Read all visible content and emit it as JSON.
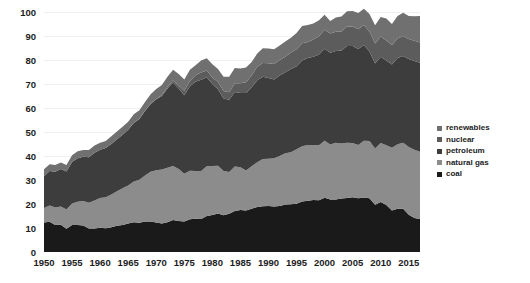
{
  "chart_data": {
    "type": "area",
    "title": "",
    "subtitle": "",
    "xlabel": "",
    "ylabel": "",
    "stacked": true,
    "grid": true,
    "legend_position": "right",
    "xlim": [
      1950,
      2017
    ],
    "ylim": [
      0,
      100
    ],
    "yticks": [
      0,
      10,
      20,
      30,
      40,
      50,
      60,
      70,
      80,
      90,
      100
    ],
    "xticks": [
      1950,
      1955,
      1960,
      1965,
      1970,
      1975,
      1980,
      1985,
      1990,
      1995,
      2000,
      2005,
      2010,
      2015
    ],
    "x": [
      1950,
      1951,
      1952,
      1953,
      1954,
      1955,
      1956,
      1957,
      1958,
      1959,
      1960,
      1961,
      1962,
      1963,
      1964,
      1965,
      1966,
      1967,
      1968,
      1969,
      1970,
      1971,
      1972,
      1973,
      1974,
      1975,
      1976,
      1977,
      1978,
      1979,
      1980,
      1981,
      1982,
      1983,
      1984,
      1985,
      1986,
      1987,
      1988,
      1989,
      1990,
      1991,
      1992,
      1993,
      1994,
      1995,
      1996,
      1997,
      1998,
      1999,
      2000,
      2001,
      2002,
      2003,
      2004,
      2005,
      2006,
      2007,
      2008,
      2009,
      2010,
      2011,
      2012,
      2013,
      2014,
      2015,
      2016,
      2017
    ],
    "series": [
      {
        "name": "coal",
        "color": "#1a1a1a",
        "values": [
          12.3,
          12.6,
          11.3,
          11.4,
          9.7,
          11.2,
          11.3,
          11.0,
          9.8,
          9.8,
          10.1,
          9.9,
          10.3,
          10.9,
          11.3,
          11.9,
          12.4,
          12.2,
          12.7,
          12.7,
          12.3,
          11.9,
          12.4,
          13.3,
          12.9,
          12.7,
          13.6,
          13.9,
          13.8,
          15.0,
          15.4,
          16.0,
          15.3,
          15.9,
          17.1,
          17.5,
          17.3,
          18.0,
          18.8,
          19.1,
          19.2,
          19.0,
          19.2,
          19.8,
          19.9,
          20.1,
          21.0,
          21.4,
          21.7,
          21.6,
          22.6,
          21.9,
          21.9,
          22.3,
          22.5,
          22.8,
          22.4,
          22.7,
          22.4,
          19.7,
          20.8,
          19.6,
          17.3,
          18.0,
          18.0,
          15.5,
          14.2,
          13.8
        ]
      },
      {
        "name": "natural gas",
        "color": "#8c8c8c",
        "values": [
          6.0,
          6.8,
          7.2,
          7.6,
          8.0,
          9.0,
          9.6,
          10.2,
          10.7,
          11.7,
          12.4,
          12.9,
          13.7,
          14.4,
          15.3,
          15.8,
          17.0,
          17.9,
          19.2,
          20.7,
          21.8,
          22.5,
          22.7,
          22.5,
          21.7,
          19.9,
          20.3,
          19.9,
          20.0,
          20.7,
          20.4,
          19.9,
          18.5,
          17.4,
          18.5,
          17.8,
          16.7,
          17.7,
          18.6,
          19.7,
          19.7,
          20.1,
          20.8,
          21.3,
          21.7,
          22.7,
          23.1,
          23.2,
          22.9,
          22.9,
          23.8,
          22.9,
          23.6,
          22.9,
          23.0,
          22.6,
          22.2,
          23.7,
          23.8,
          23.4,
          24.6,
          24.9,
          26.1,
          26.9,
          27.5,
          28.2,
          28.4,
          28.0
        ]
      },
      {
        "name": "petroleum",
        "color": "#3d3d3d",
        "values": [
          13.3,
          14.4,
          14.9,
          15.6,
          15.8,
          17.3,
          18.2,
          18.5,
          19.0,
          19.9,
          20.1,
          20.5,
          21.0,
          21.7,
          22.3,
          23.2,
          24.4,
          25.3,
          26.9,
          28.3,
          29.5,
          30.6,
          33.0,
          34.8,
          33.5,
          32.7,
          35.2,
          37.1,
          38.0,
          37.1,
          34.2,
          31.9,
          30.2,
          30.1,
          31.1,
          30.9,
          32.2,
          32.9,
          34.2,
          34.2,
          33.6,
          32.8,
          33.5,
          33.8,
          34.7,
          34.6,
          35.7,
          36.2,
          36.8,
          37.8,
          38.3,
          38.2,
          38.2,
          38.8,
          40.3,
          40.4,
          40.0,
          39.8,
          37.3,
          35.4,
          36.0,
          35.3,
          34.7,
          35.9,
          36.2,
          36.7,
          37.0,
          37.1
        ]
      },
      {
        "name": "nuclear",
        "color": "#5c5c5c",
        "values": [
          0.0,
          0.0,
          0.0,
          0.0,
          0.0,
          0.0,
          0.0,
          0.0,
          0.0,
          0.0,
          0.0,
          0.0,
          0.0,
          0.0,
          0.0,
          0.0,
          0.1,
          0.1,
          0.1,
          0.2,
          0.2,
          0.4,
          0.6,
          0.9,
          1.3,
          1.9,
          2.1,
          2.7,
          3.0,
          2.8,
          2.7,
          3.0,
          3.1,
          3.2,
          3.6,
          4.1,
          4.5,
          4.9,
          5.6,
          5.7,
          6.1,
          6.4,
          6.5,
          6.5,
          6.8,
          7.1,
          7.2,
          6.7,
          7.1,
          7.6,
          7.9,
          8.0,
          8.1,
          7.9,
          8.2,
          8.2,
          8.2,
          8.4,
          8.4,
          8.4,
          8.4,
          8.3,
          8.1,
          8.2,
          8.3,
          8.3,
          8.4,
          8.4
        ]
      },
      {
        "name": "renewables",
        "color": "#707070",
        "values": [
          2.9,
          2.8,
          2.8,
          2.7,
          2.7,
          2.8,
          2.9,
          2.8,
          3.0,
          3.0,
          2.9,
          3.0,
          3.2,
          3.2,
          3.3,
          3.4,
          3.5,
          3.6,
          3.6,
          3.8,
          4.1,
          4.2,
          4.3,
          4.4,
          4.8,
          4.7,
          4.7,
          4.2,
          5.0,
          5.1,
          5.5,
          5.5,
          5.9,
          6.4,
          6.4,
          6.2,
          6.2,
          5.7,
          5.5,
          6.2,
          6.2,
          6.2,
          6.0,
          6.3,
          6.2,
          6.7,
          7.2,
          7.1,
          6.7,
          6.7,
          6.3,
          5.3,
          5.9,
          6.2,
          6.3,
          6.4,
          6.8,
          6.8,
          7.3,
          7.6,
          8.1,
          9.2,
          8.8,
          9.3,
          9.7,
          9.6,
          10.2,
          11.0
        ]
      }
    ]
  },
  "legend": {
    "items": [
      {
        "label": "renewables"
      },
      {
        "label": "nuclear"
      },
      {
        "label": "petroleum"
      },
      {
        "label": "natural gas"
      },
      {
        "label": "coal"
      }
    ]
  },
  "colors": {
    "background": "#ffffff",
    "gridline": "#f0f0f0",
    "text": "#1c1c1c"
  }
}
